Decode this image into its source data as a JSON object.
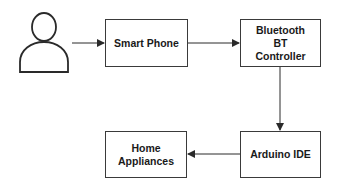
{
  "diagram": {
    "type": "block-flow",
    "colors": {
      "stroke": "#2a2a2a",
      "box_fill": "#ffffff",
      "background": "#ffffff",
      "text": "#1a1a1a"
    },
    "nodes": [
      {
        "id": "user",
        "label": "",
        "icon": "user-icon"
      },
      {
        "id": "smartphone",
        "label": "Smart Phone"
      },
      {
        "id": "bluetooth",
        "label": "Bluetooth BT Controller"
      },
      {
        "id": "arduino",
        "label": "Arduino IDE"
      },
      {
        "id": "appliances",
        "label": "Home Appliances"
      }
    ],
    "edges": [
      {
        "from": "user",
        "to": "smartphone"
      },
      {
        "from": "smartphone",
        "to": "bluetooth"
      },
      {
        "from": "bluetooth",
        "to": "arduino"
      },
      {
        "from": "arduino",
        "to": "appliances"
      }
    ]
  }
}
